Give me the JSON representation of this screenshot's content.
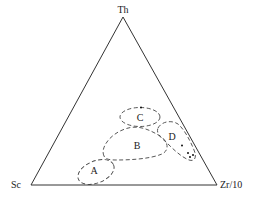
{
  "diagram": {
    "type": "ternary",
    "vertices": {
      "top": "Th",
      "bottom_left": "Sc",
      "bottom_right": "Zr/10"
    },
    "regions": [
      {
        "id": "A",
        "label": "A"
      },
      {
        "id": "B",
        "label": "B"
      },
      {
        "id": "C",
        "label": "C"
      },
      {
        "id": "D",
        "label": "D"
      }
    ],
    "colors": {
      "line": "#333333",
      "points": "#111111",
      "background": "#ffffff"
    }
  }
}
